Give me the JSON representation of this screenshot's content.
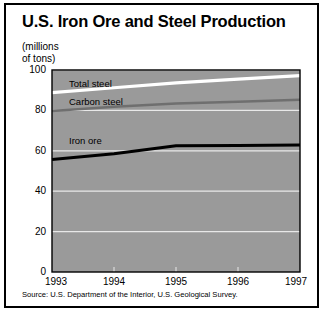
{
  "figure": {
    "title": "U.S. Iron Ore and Steel Production",
    "units_line1": "(millions",
    "units_line2": "of tons)",
    "source": "Source: U.S. Department of the Interior, U.S. Geological Survey.",
    "border_color": "#000000",
    "plot_background": "#9a9a9a",
    "gridline_color": "#e8e8e8"
  },
  "chart_data": {
    "type": "line",
    "title": "U.S. Iron Ore and Steel Production",
    "xlabel": "",
    "ylabel": "(millions of tons)",
    "x": [
      1993,
      1994,
      1995,
      1996,
      1997
    ],
    "xtick_labels": [
      "1993",
      "1994",
      "1995",
      "1996",
      "1997"
    ],
    "ytick_labels": [
      "0",
      "20",
      "40",
      "60",
      "80",
      "100"
    ],
    "yticks": [
      0,
      20,
      40,
      60,
      80,
      100
    ],
    "ylim": [
      0,
      100
    ],
    "xlim": [
      1993,
      1997
    ],
    "grid": true,
    "legend": "inline-annotations",
    "series": [
      {
        "name": "Total steel",
        "label": "Total steel",
        "color": "#ffffff",
        "width": 3.2,
        "values": [
          88.8,
          91.2,
          93.6,
          95.5,
          97.2
        ]
      },
      {
        "name": "Carbon steel",
        "label": "Carbon steel",
        "color": "#6f6f6f",
        "width": 2.4,
        "values": [
          79.7,
          81.8,
          83.4,
          84.3,
          85.3
        ]
      },
      {
        "name": "Iron ore",
        "label": "Iron ore",
        "color": "#000000",
        "width": 3.0,
        "values": [
          55.7,
          58.5,
          62.5,
          62.6,
          62.9
        ]
      }
    ]
  },
  "axis": {
    "y_labels": [
      {
        "text": "100",
        "value": 100
      },
      {
        "text": "80",
        "value": 80
      },
      {
        "text": "60",
        "value": 60
      },
      {
        "text": "40",
        "value": 40
      },
      {
        "text": "20",
        "value": 20
      },
      {
        "text": "0",
        "value": 0
      }
    ],
    "x_labels": [
      {
        "text": "1993",
        "value": 1993
      },
      {
        "text": "1994",
        "value": 1994
      },
      {
        "text": "1995",
        "value": 1995
      },
      {
        "text": "1996",
        "value": 1996
      },
      {
        "text": "1997",
        "value": 1997
      }
    ]
  },
  "annotations": [
    {
      "name": "total-steel",
      "text": "Total steel"
    },
    {
      "name": "carbon-steel",
      "text": "Carbon steel"
    },
    {
      "name": "iron-ore",
      "text": "Iron ore"
    }
  ]
}
